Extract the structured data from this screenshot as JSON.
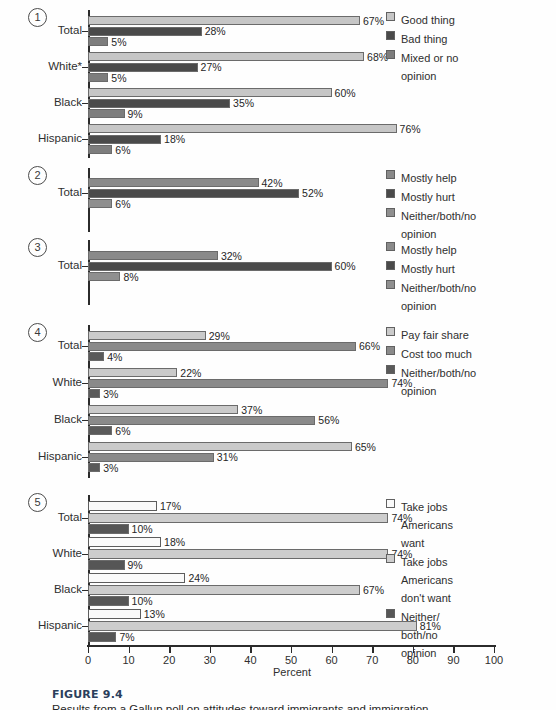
{
  "figure": {
    "label": "FIGURE 9.4",
    "description": "Results from a Gallup poll on attitudes toward immigrants and immigration"
  },
  "axis": {
    "title": "Percent",
    "ticks": [
      "0",
      "10",
      "20",
      "30",
      "40",
      "50",
      "60",
      "70",
      "80",
      "90",
      "100"
    ],
    "min": 0,
    "max": 100
  },
  "colors": {
    "light": "#c6c6c6",
    "dark": "#4a4a4a",
    "medium": "#7d7d7d",
    "white": "#fafafa",
    "caption_blue": "#2b3f5c"
  },
  "chart_data": {
    "type": "bar",
    "orientation": "horizontal",
    "title": "Results from a Gallup poll on attitudes toward immigrants and immigration",
    "xlabel": "Percent",
    "ylabel": "",
    "xlim": [
      0,
      100
    ],
    "grid": false,
    "legend_position": "right",
    "value_suffix": "%",
    "panels": [
      {
        "number": "1",
        "categories": [
          "Total",
          "White*",
          "Black",
          "Hispanic"
        ],
        "series": [
          {
            "name": "Good thing",
            "swatch": "light",
            "values": [
              67,
              68,
              60,
              76
            ]
          },
          {
            "name": "Bad thing",
            "swatch": "dark",
            "values": [
              28,
              27,
              35,
              18
            ]
          },
          {
            "name": "Mixed or no\nopinion",
            "swatch": "medium",
            "values": [
              5,
              5,
              9,
              6
            ]
          }
        ]
      },
      {
        "number": "2",
        "categories": [
          "Total"
        ],
        "series": [
          {
            "name": "Mostly help",
            "swatch": "medium",
            "values": [
              42
            ]
          },
          {
            "name": "Mostly hurt",
            "swatch": "dark",
            "values": [
              52
            ]
          },
          {
            "name": "Neither/both/no\nopinion",
            "swatch": "medium",
            "values": [
              6
            ]
          }
        ]
      },
      {
        "number": "3",
        "categories": [
          "Total"
        ],
        "series": [
          {
            "name": "Mostly help",
            "swatch": "medium",
            "values": [
              32
            ]
          },
          {
            "name": "Mostly hurt",
            "swatch": "dark",
            "values": [
              60
            ]
          },
          {
            "name": "Neither/both/no\nopinion",
            "swatch": "medium",
            "values": [
              8
            ]
          }
        ]
      },
      {
        "number": "4",
        "categories": [
          "Total",
          "White",
          "Black",
          "Hispanic"
        ],
        "series": [
          {
            "name": "Pay fair share",
            "swatch": "light",
            "values": [
              29,
              22,
              37,
              65
            ]
          },
          {
            "name": "Cost too much",
            "swatch": "medium",
            "values": [
              66,
              74,
              56,
              31
            ]
          },
          {
            "name": "Neither/both/no\nopinion",
            "swatch": "dark",
            "values": [
              4,
              3,
              6,
              3
            ]
          }
        ]
      },
      {
        "number": "5",
        "categories": [
          "Total",
          "White",
          "Black",
          "Hispanic"
        ],
        "series": [
          {
            "name": "Take jobs\nAmericans\nwant",
            "swatch": "white",
            "values": [
              17,
              18,
              24,
              13
            ]
          },
          {
            "name": "Take jobs\nAmericans\ndon't want",
            "swatch": "light",
            "values": [
              74,
              74,
              67,
              81
            ]
          },
          {
            "name": "Neither/\nboth/no\nopinion",
            "swatch": "dark",
            "values": [
              10,
              9,
              10,
              7
            ]
          }
        ]
      }
    ]
  }
}
